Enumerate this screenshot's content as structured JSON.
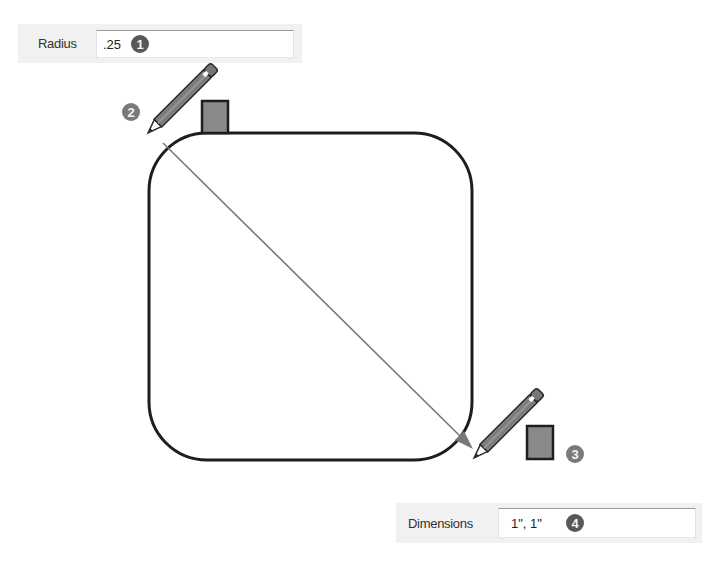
{
  "radius_box": {
    "label": "Radius",
    "value": ".25",
    "step_badge": "1"
  },
  "dimensions_box": {
    "label": "Dimensions",
    "value": "1\", 1\"",
    "step_badge": "4"
  },
  "canvas": {
    "start_step_badge": "2",
    "end_step_badge": "3",
    "icons": [
      "pencil-icon",
      "inference-square-icon",
      "pencil-icon",
      "inference-square-icon"
    ],
    "colors": {
      "outline": "#1e1e1e",
      "arrow": "#777777",
      "square_fill": "#8a8a8a",
      "badge_dark": "#585858",
      "badge_mid": "#7a7a7a"
    }
  }
}
